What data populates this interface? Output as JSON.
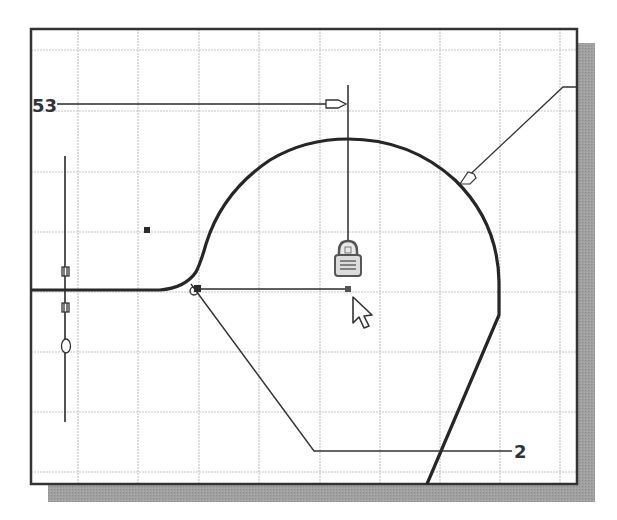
{
  "canvas": {
    "name": "sketch-canvas",
    "background": "#ffffff",
    "frame_color": "#333333",
    "shadow_color": "#9a9a9a",
    "grid_color": "#c8c8c8",
    "geometry_color": "#2a2a2a"
  },
  "dimensions": [
    {
      "id": "dimension-horizontal",
      "value": "53"
    },
    {
      "id": "dimension-radius",
      "value": "2"
    }
  ],
  "glyphs": {
    "lock_icon": "lock-icon",
    "cursor_icon": "arrow-cursor-icon",
    "constraint_glyph": "0"
  }
}
